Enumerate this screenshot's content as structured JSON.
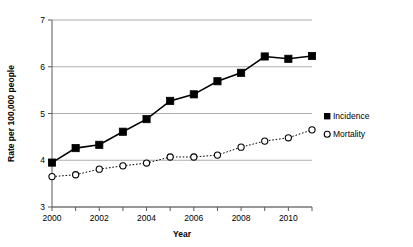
{
  "chart_data": {
    "type": "line",
    "title": "",
    "xlabel": "Year",
    "ylabel": "Rate per 100,000 people",
    "x": [
      2000,
      2001,
      2002,
      2003,
      2004,
      2005,
      2006,
      2007,
      2008,
      2009,
      2010,
      2011
    ],
    "xlim": [
      2000,
      2011
    ],
    "ylim": [
      3,
      7
    ],
    "yticks": [
      3,
      4,
      5,
      6,
      7
    ],
    "ytick_labels": [
      "3",
      "4",
      "5",
      "6",
      "7"
    ],
    "xticks": [
      2000,
      2001,
      2002,
      2003,
      2004,
      2005,
      2006,
      2007,
      2008,
      2009,
      2010,
      2011
    ],
    "xtick_labels": [
      "2000",
      "",
      "2002",
      "",
      "2004",
      "",
      "2006",
      "",
      "2008",
      "",
      "2010",
      ""
    ],
    "grid": "horizontal",
    "legend_position": "right",
    "series": [
      {
        "name": "Incidence",
        "marker": "filled-square",
        "line_style": "solid",
        "color": "#000000",
        "values": [
          3.95,
          4.26,
          4.33,
          4.61,
          4.88,
          5.27,
          5.41,
          5.69,
          5.87,
          6.22,
          6.17,
          6.23
        ]
      },
      {
        "name": "Mortality",
        "marker": "open-circle",
        "line_style": "dotted",
        "color": "#000000",
        "values": [
          3.65,
          3.69,
          3.81,
          3.88,
          3.94,
          4.07,
          4.07,
          4.11,
          4.28,
          4.41,
          4.48,
          4.65
        ]
      }
    ]
  },
  "legend": {
    "items": [
      {
        "label": "Incidence",
        "marker": "filled-square"
      },
      {
        "label": "Mortality",
        "marker": "open-circle"
      }
    ]
  }
}
